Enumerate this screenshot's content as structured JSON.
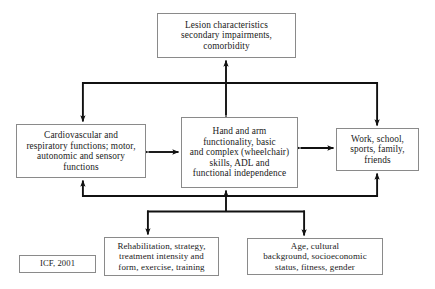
{
  "diagram": {
    "citation_label": "ICF, 2001",
    "nodes": {
      "lesion": {
        "id": "lesion-characteristics",
        "text": "Lesion characteristics\nsecondary impairments,\ncomorbidity"
      },
      "body_functions": {
        "id": "body-functions",
        "text": "Cardiovascular and\nrespiratory functions; motor,\nautonomic and sensory\nfunctions"
      },
      "activity": {
        "id": "hand-arm-functionality",
        "text": "Hand and arm\nfunctionality, basic\nand complex (wheelchair)\nskills, ADL and\nfunctional independence"
      },
      "participation": {
        "id": "participation",
        "text": "Work, school,\nsports, family,\nfriends"
      },
      "rehabilitation": {
        "id": "rehabilitation-factors",
        "text": "Rehabilitation, strategy,\ntreatment intensity and\nform, exercise, training"
      },
      "personal": {
        "id": "personal-factors",
        "text": "Age, cultural\nbackground, socioeconomic\nstatus, fitness, gender"
      }
    },
    "colors": {
      "box_border": "#8a8a8a",
      "arrow": "#111111",
      "text": "#1a1a1a",
      "background": "#ffffff"
    },
    "connectors": [
      {
        "name": "activity-to-lesion",
        "from": "activity",
        "to": "lesion",
        "direction": "bidirectional"
      },
      {
        "name": "lesion-bus-to-body",
        "from": "lesion",
        "to": "body_functions",
        "direction": "down"
      },
      {
        "name": "lesion-bus-to-participation",
        "from": "lesion",
        "to": "participation",
        "direction": "down"
      },
      {
        "name": "body-to-activity",
        "from": "body_functions",
        "to": "activity",
        "direction": "bidirectional"
      },
      {
        "name": "activity-to-participation",
        "from": "activity",
        "to": "participation",
        "direction": "bidirectional"
      },
      {
        "name": "bottom-bus-to-body",
        "from": "bottom_bus",
        "to": "body_functions",
        "direction": "up"
      },
      {
        "name": "bottom-bus-to-activity",
        "from": "bottom_bus",
        "to": "activity",
        "direction": "up"
      },
      {
        "name": "bottom-bus-to-participation",
        "from": "bottom_bus",
        "to": "participation",
        "direction": "up"
      },
      {
        "name": "bus-to-rehabilitation",
        "from": "bottom_bus",
        "to": "rehabilitation",
        "direction": "down"
      },
      {
        "name": "bus-to-personal",
        "from": "bottom_bus",
        "to": "personal",
        "direction": "down"
      }
    ]
  }
}
